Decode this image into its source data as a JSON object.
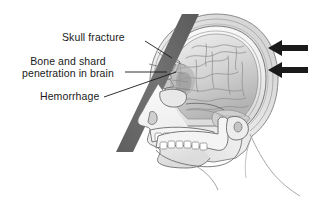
{
  "figure": {
    "background_color": "#ffffff",
    "width": 315,
    "height": 201
  },
  "labels": [
    {
      "id": "skull-fracture",
      "text": "Skull fracture",
      "lines": [
        "Skull fracture"
      ]
    },
    {
      "id": "bone-shard",
      "text": "Bone and shard penetration in brain",
      "lines": [
        "Bone and shard",
        "penetration in brain"
      ]
    },
    {
      "id": "hemorrhage",
      "text": "Hemorrhage",
      "lines": [
        "Hemorrhage"
      ]
    }
  ],
  "anatomy": {
    "head_view": "lateral left-facing profile",
    "structures": [
      "scalp",
      "skull",
      "brain",
      "cerebellum",
      "orbit",
      "nasal bone",
      "maxilla",
      "mandible",
      "teeth",
      "ear canal"
    ],
    "fracture_site": "left frontal-parietal region",
    "impact_object": "diagonal gray bar",
    "impact_direction": "from posterior, pointing left"
  },
  "arrows": {
    "count": 2,
    "direction": "left",
    "color": "#1a1a1a",
    "meaning": "direction of impact force"
  },
  "colors": {
    "outline": "#4d4d4d",
    "bone_fill": "#f2f2f2",
    "brain_fill": "#d9d9d9",
    "impact_bar": "#6e6e6e",
    "text": "#1a1a1a",
    "leader_line": "#1a1a1a"
  }
}
